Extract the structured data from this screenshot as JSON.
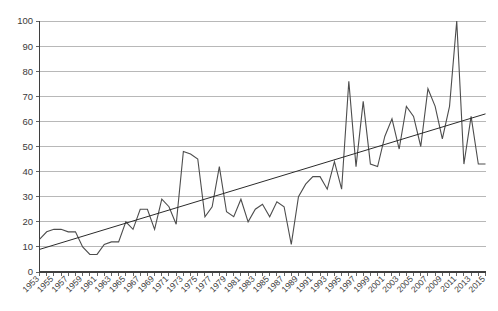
{
  "chart_data": {
    "type": "line",
    "title": "",
    "subtitle": "",
    "xlabel": "",
    "ylabel": "",
    "ylim": [
      0,
      100
    ],
    "xlim": [
      1953,
      2015
    ],
    "grid": true,
    "legend": null,
    "y_ticks": [
      0,
      10,
      20,
      30,
      40,
      50,
      60,
      70,
      80,
      90,
      100
    ],
    "x_tick_labels": [
      "1953",
      "1955",
      "1957",
      "1959",
      "1961",
      "1963",
      "1965",
      "1967",
      "1969",
      "1971",
      "1973",
      "1975",
      "1977",
      "1979",
      "1981",
      "1983",
      "1985",
      "1987",
      "1989",
      "1991",
      "1993",
      "1995",
      "1997",
      "1999",
      "2001",
      "2003",
      "2005",
      "2007",
      "2009",
      "2011",
      "2013",
      "2015"
    ],
    "x": [
      1953,
      1954,
      1955,
      1956,
      1957,
      1958,
      1959,
      1960,
      1961,
      1962,
      1963,
      1964,
      1965,
      1966,
      1967,
      1968,
      1969,
      1970,
      1971,
      1972,
      1973,
      1974,
      1975,
      1976,
      1977,
      1978,
      1979,
      1980,
      1981,
      1982,
      1983,
      1984,
      1985,
      1986,
      1987,
      1988,
      1989,
      1990,
      1991,
      1992,
      1993,
      1994,
      1995,
      1996,
      1997,
      1998,
      1999,
      2000,
      2001,
      2002,
      2003,
      2004,
      2005,
      2006,
      2007,
      2008,
      2009,
      2010,
      2011,
      2012,
      2013,
      2014,
      2015
    ],
    "series": [
      {
        "name": "annual value",
        "type": "line",
        "values": [
          13,
          16,
          17,
          17,
          16,
          16,
          10,
          7,
          7,
          11,
          12,
          12,
          20,
          17,
          25,
          25,
          17,
          29,
          26,
          19,
          48,
          47,
          45,
          22,
          26,
          42,
          24,
          22,
          29,
          20,
          25,
          27,
          22,
          28,
          26,
          11,
          30,
          35,
          38,
          38,
          33,
          44,
          33,
          76,
          42,
          68,
          43,
          42,
          54,
          61,
          49,
          66,
          62,
          50,
          73,
          66,
          53,
          66,
          100,
          43,
          62,
          43,
          43
        ]
      },
      {
        "name": "linear trend",
        "type": "trendline",
        "endpoints": [
          {
            "x": 1953,
            "y": 9
          },
          {
            "x": 2015,
            "y": 63
          }
        ]
      }
    ]
  },
  "colors": {
    "series_line": "#4d4d4d",
    "trend_line": "#2b2b2b",
    "gridline": "#a6a6a6",
    "axis": "#3f3f3f",
    "tick_text": "#3a3a3a",
    "background": "#ffffff"
  }
}
